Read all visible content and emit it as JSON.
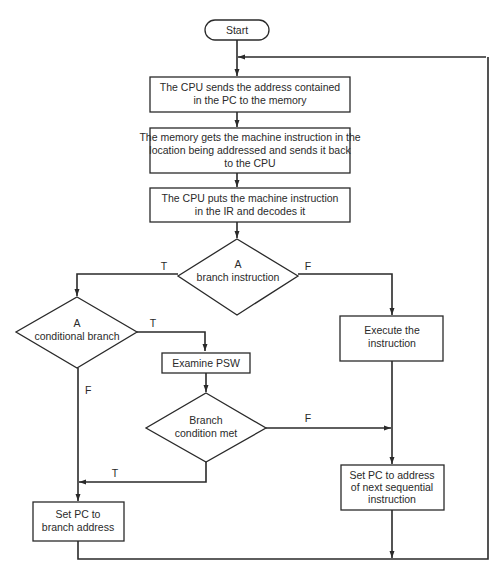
{
  "diagram": {
    "type": "flowchart",
    "nodes": {
      "start": {
        "label": "Start"
      },
      "send_address": {
        "lines": [
          "The CPU sends the address contained",
          "in the PC to the memory"
        ]
      },
      "memory_fetch": {
        "lines": [
          "The memory gets the machine instruction in the",
          "location being addressed and sends it back",
          "to the CPU"
        ]
      },
      "decode": {
        "lines": [
          "The CPU puts the machine instruction",
          "in the IR and decodes it"
        ]
      },
      "is_branch": {
        "lines": [
          "A",
          "branch instruction"
        ]
      },
      "is_conditional": {
        "lines": [
          "A",
          "conditional branch"
        ]
      },
      "examine_psw": {
        "label": "Examine PSW"
      },
      "condition_met": {
        "lines": [
          "Branch",
          "condition met"
        ]
      },
      "execute": {
        "lines": [
          "Execute the",
          "instruction"
        ]
      },
      "set_pc_next": {
        "lines": [
          "Set PC to address",
          "of next sequential",
          "instruction"
        ]
      },
      "set_pc_branch": {
        "lines": [
          "Set PC to",
          "branch address"
        ]
      }
    },
    "edge_labels": {
      "is_branch_true": "T",
      "is_branch_false": "F",
      "is_conditional_true": "T",
      "is_conditional_false": "F",
      "condition_met_false": "F",
      "condition_met_true": "T"
    }
  }
}
